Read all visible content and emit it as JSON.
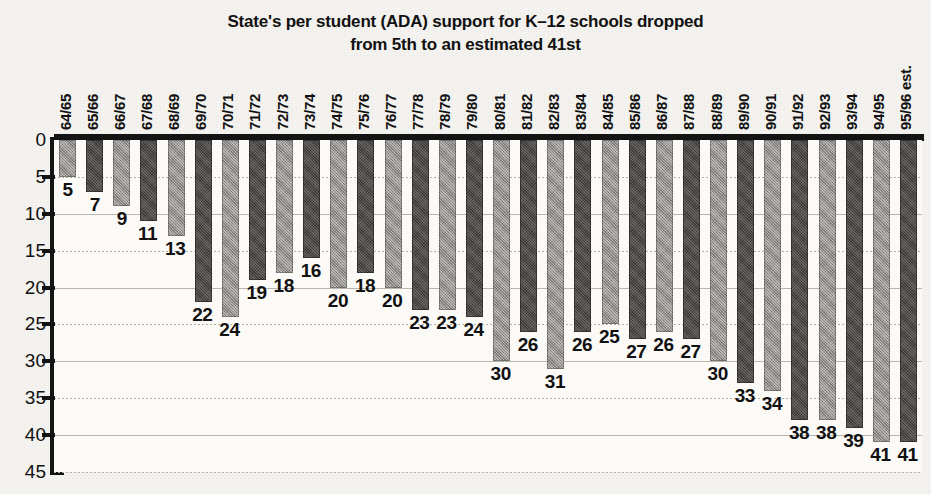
{
  "chart_data": {
    "type": "bar",
    "title_line1": "State's per student (ADA) support for K–12 schools dropped",
    "title_line2": "from 5th to an estimated 41st",
    "xlabel": "",
    "ylabel": "",
    "ylim": [
      0,
      45
    ],
    "y_inverted": true,
    "y_ticks": [
      0,
      5,
      10,
      15,
      20,
      25,
      30,
      35,
      40,
      45
    ],
    "grid": true,
    "legend": "none",
    "categories": [
      "64/65",
      "65/66",
      "66/67",
      "67/68",
      "68/69",
      "69/70",
      "70/71",
      "71/72",
      "72/73",
      "73/74",
      "74/75",
      "75/76",
      "76/77",
      "77/78",
      "78/79",
      "79/80",
      "80/81",
      "81/82",
      "82/83",
      "83/84",
      "84/85",
      "85/86",
      "86/87",
      "87/88",
      "88/89",
      "89/90",
      "90/91",
      "91/92",
      "92/93",
      "93/94",
      "94/95",
      "95/96 est."
    ],
    "values": [
      5,
      7,
      9,
      11,
      13,
      22,
      24,
      19,
      18,
      16,
      20,
      18,
      20,
      23,
      23,
      24,
      30,
      26,
      31,
      26,
      25,
      27,
      26,
      27,
      30,
      33,
      34,
      38,
      38,
      39,
      41,
      41
    ],
    "bar_shades": [
      "light",
      "dark",
      "light",
      "dark",
      "light",
      "dark",
      "light",
      "dark",
      "light",
      "dark",
      "light",
      "dark",
      "light",
      "dark",
      "light",
      "dark",
      "light",
      "dark",
      "light",
      "dark",
      "light",
      "dark",
      "light",
      "dark",
      "light",
      "dark",
      "light",
      "dark",
      "light",
      "dark",
      "light",
      "dark"
    ],
    "colors": {
      "bar_light": "#8f8d89",
      "bar_dark": "#4a4846",
      "axis": "#141414",
      "grid": "#b9b6af",
      "plot_background": "#fbfaf7",
      "page_background": "#f4f2ee",
      "text": "#111111"
    }
  }
}
